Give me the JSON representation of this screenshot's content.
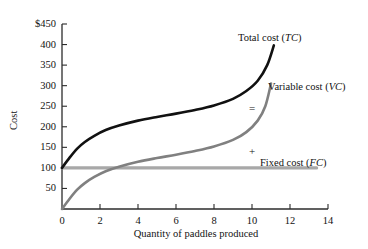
{
  "chart_data": {
    "type": "line",
    "title": "",
    "xlabel": "Quantity of paddles produced",
    "ylabel": "Cost",
    "xlim": [
      0,
      14
    ],
    "ylim": [
      0,
      450
    ],
    "grid": false,
    "legend_position": "inline-right",
    "x_ticks": [
      "0",
      "2",
      "4",
      "6",
      "8",
      "10",
      "12",
      "14"
    ],
    "x_tick_values": [
      0,
      2,
      4,
      6,
      8,
      10,
      12,
      14
    ],
    "y_ticks": [
      "50",
      "100",
      "150",
      "200",
      "250",
      "300",
      "350",
      "400",
      "$450"
    ],
    "y_tick_values": [
      50,
      100,
      150,
      200,
      250,
      300,
      350,
      400,
      450
    ],
    "annotations": [
      {
        "name": "equals-symbol",
        "text": "=",
        "x": 10.0,
        "y": 245
      },
      {
        "name": "plus-symbol",
        "text": "+",
        "x": 10.0,
        "y": 140
      }
    ],
    "series": [
      {
        "name": "Total cost (TC)",
        "label_text": "Total cost",
        "label_abbrev": "TC",
        "color": "#111111",
        "width": 2.6,
        "x": [
          0.0,
          0.4,
          0.8,
          1.2,
          1.7,
          2.3,
          3.0,
          4.0,
          5.0,
          6.0,
          7.0,
          8.0,
          9.0,
          9.7,
          10.3,
          10.8,
          11.15
        ],
        "y": [
          100,
          125,
          147,
          163,
          178,
          192,
          203,
          215,
          224,
          232,
          241,
          252,
          268,
          287,
          312,
          350,
          398
        ]
      },
      {
        "name": "Variable cost (VC)",
        "label_text": "Variable cost",
        "label_abbrev": "VC",
        "color": "#808080",
        "width": 2.6,
        "x": [
          0.0,
          0.4,
          0.8,
          1.2,
          1.7,
          2.3,
          3.0,
          4.0,
          5.0,
          6.0,
          7.0,
          8.0,
          9.0,
          9.7,
          10.3,
          10.7,
          11.0
        ],
        "y": [
          0,
          25,
          47,
          63,
          78,
          92,
          103,
          115,
          124,
          132,
          141,
          152,
          168,
          187,
          215,
          250,
          305
        ]
      },
      {
        "name": "Fixed cost (FC)",
        "label_text": "Fixed cost",
        "label_abbrev": "FC",
        "color": "#a8a8a8",
        "width": 3.2,
        "x": [
          0.0,
          13.4
        ],
        "y": [
          100,
          100
        ]
      }
    ]
  },
  "labels": {
    "total_cost": "Total cost (",
    "total_cost_abbrev": "TC",
    "variable_cost": "Variable cost (",
    "variable_cost_abbrev": "VC",
    "fixed_cost": "Fixed cost (",
    "fixed_cost_abbrev": "FC",
    "close_paren": ")"
  },
  "axes": {
    "y_title": "Cost",
    "x_title": "Quantity of paddles produced"
  }
}
